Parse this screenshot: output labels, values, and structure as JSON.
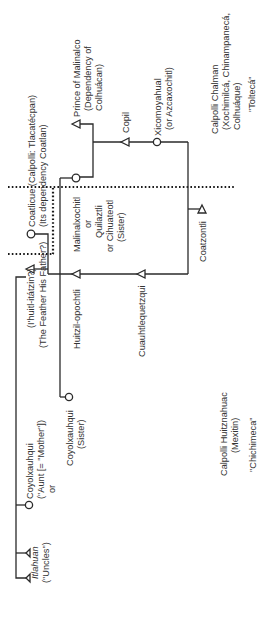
{
  "diagram": {
    "orientation": "rotated-90-ccw",
    "nodes": {
      "prince_malinalco": {
        "symbol": "triangle",
        "lines": [
          "Prince of Malinalco",
          "(Dependency of",
          "Colhuácan)"
        ]
      },
      "copil": {
        "symbol": "triangle",
        "lines": [
          "Copil"
        ]
      },
      "xicomoyahual": {
        "symbol": "circle",
        "lines": [
          "Xicomoyahual",
          "(or Azcaxochitl)"
        ]
      },
      "calpolli_chalman": {
        "lines": [
          "Calpolli Chalman",
          "(Xochimilcá, Chinampanecá,",
          "Colhuáque)"
        ]
      },
      "tolteca": {
        "lines": [
          "\"Toltecá\""
        ]
      },
      "coatlicue": {
        "symbol": "circle",
        "lines": [
          "Coatlicue (Calpolli: Tlacatécpan)",
          "(Its dependency Coatlan)"
        ]
      },
      "malinalxochitl": {
        "symbol": "circle",
        "lines": [
          "Malinalxochitl",
          "or",
          "Quilaztli",
          "or Cihuateotl",
          "(Sister)"
        ]
      },
      "coatzontli": {
        "symbol": "triangle",
        "lines": [
          "Coatzontli"
        ]
      },
      "ihuitl_itatzin": {
        "symbol": "triangle",
        "lines": [
          "(I'huitl-itátzin?)",
          "(The Feather His Father?)"
        ]
      },
      "huitzilopochtli": {
        "symbol": "triangle",
        "lines": [
          "Huitzil-opochtli"
        ]
      },
      "cuauhtlequetzqui": {
        "symbol": "triangle",
        "lines": [
          "Cuauhtlequetzqui"
        ]
      },
      "coyolxauhqui_sister": {
        "symbol": "circle",
        "lines": [
          "Coyolxauhqui",
          "(Sister)"
        ]
      },
      "calpolli_huitznahuac": {
        "lines": [
          "Calpolli Huitznahuac",
          "(Mexitin)"
        ]
      },
      "chichimeca": {
        "lines": [
          "\"Chichimeca\""
        ]
      },
      "coyolxauhqui_aunt": {
        "symbol": "circle",
        "lines": [
          "Coyolxauhqui",
          "(\"Aunt [= \"Mother\"])",
          "or"
        ]
      },
      "itlahuan": {
        "symbol": "triangle",
        "lines": [
          "Itlahuan",
          "(\"Uncles\")"
        ]
      }
    },
    "colors": {
      "line": "#2a2a2a",
      "text": "#333333",
      "background": "#ffffff"
    }
  }
}
